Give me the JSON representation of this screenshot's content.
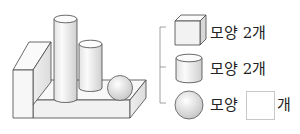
{
  "figure": {
    "stroke_color": "#444444",
    "fill_light": "#f7f7f7",
    "fill_shade": "#d9d9d9"
  },
  "classification": {
    "rows": [
      {
        "shape": "cube",
        "word": "모양",
        "count": "2",
        "unit": "개"
      },
      {
        "shape": "cylinder",
        "word": "모양",
        "count": "2",
        "unit": "개"
      },
      {
        "shape": "sphere",
        "word": "모양",
        "count": "",
        "unit": "개"
      }
    ]
  }
}
